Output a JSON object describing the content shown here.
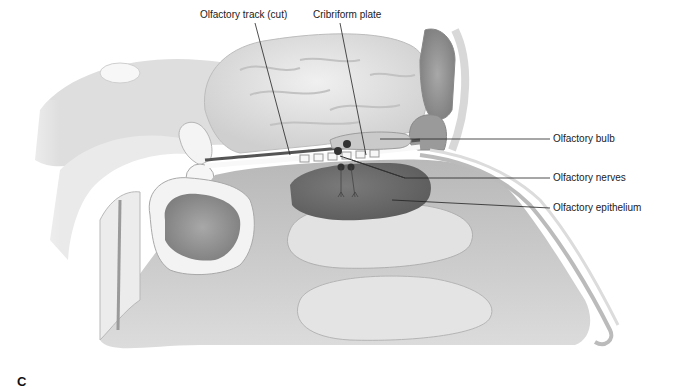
{
  "figure": {
    "panel_letter": "C",
    "labels": [
      {
        "id": "olfactory-track",
        "text": "Olfactory track (cut)"
      },
      {
        "id": "cribriform-plate",
        "text": "Cribriform plate"
      },
      {
        "id": "olfactory-bulb",
        "text": "Olfactory bulb"
      },
      {
        "id": "olfactory-nerves",
        "text": "Olfactory nerves"
      },
      {
        "id": "olfactory-epithelium",
        "text": "Olfactory epithelium"
      }
    ]
  },
  "colors": {
    "background": "#ffffff",
    "tissue_light": "#e6e6e6",
    "tissue_mid": "#c8c8c8",
    "tissue_dark": "#8a8a8a",
    "epithelium": "#6e6e6e",
    "bone": "#f2f2f2",
    "leader_line": "#222222"
  }
}
